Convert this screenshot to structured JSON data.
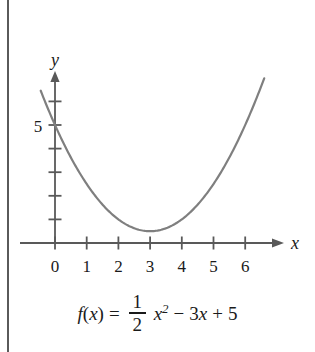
{
  "figure": {
    "name": "parabola-graph-figure",
    "background_color": "#ffffff",
    "page_edge_color": "#5a5a5a"
  },
  "chart_data": {
    "type": "line",
    "title": "",
    "subtitle": "",
    "xlabel": "x",
    "ylabel": "y",
    "function_latex": "f(x) = 1/2 x^2 - 3x + 5",
    "function_parts": {
      "name": "f",
      "open_paren": "(",
      "variable": "x",
      "close_paren": ")",
      "equals": "=",
      "fraction_numerator": "1",
      "fraction_denominator": "2",
      "quadratic_variable": "x",
      "quadratic_exponent": "2",
      "minus": "−",
      "linear_coefficient": "3",
      "linear_variable": "x",
      "plus": "+",
      "constant": "5"
    },
    "curve_color": "#7f7f7f",
    "axis_color": "#595959",
    "xlim": [
      -0.8,
      7.1
    ],
    "ylim": [
      -0.6,
      7.4
    ],
    "x_tick_labels": [
      "0",
      "1",
      "2",
      "3",
      "4",
      "5",
      "6"
    ],
    "x_tick_values": [
      0,
      1,
      2,
      3,
      4,
      5,
      6
    ],
    "y_tick_values": [
      1,
      2,
      3,
      4,
      5,
      6
    ],
    "y_tick_labels": [
      "",
      "",
      "",
      "",
      "5",
      ""
    ],
    "y_labeled_tick": {
      "value": 5,
      "label": "5"
    },
    "grid": false,
    "legend": "none",
    "vertex": {
      "x": 3,
      "y": 0.5
    },
    "y_intercept": {
      "x": 0,
      "y": 5
    },
    "coefficients": {
      "a": 0.5,
      "b": -3,
      "c": 5
    },
    "x_domain_drawn": [
      -0.45,
      6.6
    ],
    "points": [
      {
        "x": -0.45,
        "y": 6.451
      },
      {
        "x": 0.0,
        "y": 5.0
      },
      {
        "x": 0.5,
        "y": 3.625
      },
      {
        "x": 1.0,
        "y": 2.5
      },
      {
        "x": 1.5,
        "y": 1.625
      },
      {
        "x": 2.0,
        "y": 1.0
      },
      {
        "x": 2.5,
        "y": 0.625
      },
      {
        "x": 3.0,
        "y": 0.5
      },
      {
        "x": 3.5,
        "y": 0.625
      },
      {
        "x": 4.0,
        "y": 1.0
      },
      {
        "x": 4.5,
        "y": 1.625
      },
      {
        "x": 5.0,
        "y": 2.5
      },
      {
        "x": 5.5,
        "y": 3.625
      },
      {
        "x": 6.0,
        "y": 5.0
      },
      {
        "x": 6.6,
        "y": 7.08
      }
    ]
  },
  "axes": {
    "x_axis_name": "x",
    "y_axis_name": "y",
    "x_arrow": "arrow-right",
    "y_arrow": "arrow-up"
  }
}
